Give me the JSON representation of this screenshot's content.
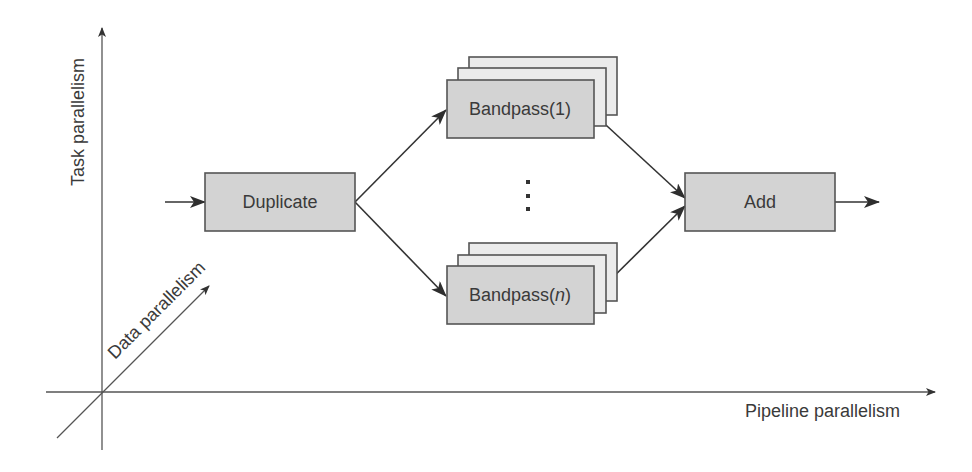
{
  "axes": {
    "vertical_label": "Task parallelism",
    "horizontal_label": "Pipeline parallelism",
    "diagonal_label": "Data parallelism"
  },
  "nodes": {
    "duplicate": "Duplicate",
    "bandpass_first": "Bandpass(1)",
    "bandpass_last_prefix": "Bandpass(",
    "bandpass_last_var": "n",
    "bandpass_last_suffix": ")",
    "add": "Add"
  },
  "ellipsis": "⋮",
  "colors": {
    "box_fill": "#d3d3d3",
    "box_back_fill": "#ebebeb",
    "stroke": "#555555",
    "text": "#3a3a3a"
  }
}
